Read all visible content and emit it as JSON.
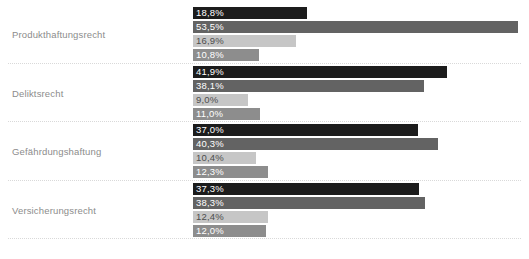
{
  "top_sliver_text": "",
  "axis": {
    "bar_origin_px": 193,
    "px_per_percent": 6.07
  },
  "palette": {
    "series_1": "#1c1c1c",
    "series_2": "#636363",
    "series_3": "#c6c6c6",
    "series_4": "#8d8d8d",
    "label_on_dark": "#ffffff",
    "label_on_light": "#4d4d4d",
    "category_label": "#8c8c8c",
    "separator": "#d9d9d9",
    "background": "#ffffff"
  },
  "chart_data": {
    "type": "bar",
    "orientation": "horizontal",
    "title": "",
    "subtitle": "",
    "xlabel": "",
    "ylabel": "",
    "xlim": [
      0,
      55
    ],
    "grid": false,
    "legend": "none",
    "value_suffix": "%",
    "decimal_separator": ",",
    "categories": [
      "Produkthaftungsrecht",
      "Deliktsrecht",
      "Gefährdungshaftung",
      "Versicherungsrecht"
    ],
    "series": [
      {
        "name": "series-1",
        "color": "#1c1c1c",
        "values": [
          18.8,
          41.9,
          37.0,
          37.3
        ]
      },
      {
        "name": "series-2",
        "color": "#636363",
        "values": [
          53.5,
          38.1,
          40.3,
          38.3
        ]
      },
      {
        "name": "series-3",
        "color": "#c6c6c6",
        "values": [
          16.9,
          9.0,
          10.4,
          12.4
        ]
      },
      {
        "name": "series-4",
        "color": "#8d8d8d",
        "values": [
          10.8,
          11.0,
          12.3,
          12.0
        ]
      }
    ],
    "groups": [
      {
        "category": "Produkthaftungsrecht",
        "top_px": 7,
        "bars": [
          {
            "value": 18.8,
            "label": "18,8%",
            "color": "#1c1c1c",
            "text_color": "#ffffff"
          },
          {
            "value": 53.5,
            "label": "53,5%",
            "color": "#636363",
            "text_color": "#ffffff"
          },
          {
            "value": 16.9,
            "label": "16,9%",
            "color": "#c6c6c6",
            "text_color": "#4d4d4d"
          },
          {
            "value": 10.8,
            "label": "10,8%",
            "color": "#8d8d8d",
            "text_color": "#ffffff"
          }
        ]
      },
      {
        "category": "Deliktsrecht",
        "top_px": 66,
        "bars": [
          {
            "value": 41.9,
            "label": "41,9%",
            "color": "#1c1c1c",
            "text_color": "#ffffff"
          },
          {
            "value": 38.1,
            "label": "38,1%",
            "color": "#636363",
            "text_color": "#ffffff"
          },
          {
            "value": 9.0,
            "label": "9,0%",
            "color": "#c6c6c6",
            "text_color": "#4d4d4d"
          },
          {
            "value": 11.0,
            "label": "11,0%",
            "color": "#8d8d8d",
            "text_color": "#ffffff"
          }
        ]
      },
      {
        "category": "Gefährdungshaftung",
        "top_px": 124,
        "bars": [
          {
            "value": 37.0,
            "label": "37,0%",
            "color": "#1c1c1c",
            "text_color": "#ffffff"
          },
          {
            "value": 40.3,
            "label": "40,3%",
            "color": "#636363",
            "text_color": "#ffffff"
          },
          {
            "value": 10.4,
            "label": "10,4%",
            "color": "#c6c6c6",
            "text_color": "#4d4d4d"
          },
          {
            "value": 12.3,
            "label": "12,3%",
            "color": "#8d8d8d",
            "text_color": "#ffffff"
          }
        ]
      },
      {
        "category": "Versicherungsrecht",
        "top_px": 183,
        "bars": [
          {
            "value": 37.3,
            "label": "37,3%",
            "color": "#1c1c1c",
            "text_color": "#ffffff"
          },
          {
            "value": 38.3,
            "label": "38,3%",
            "color": "#636363",
            "text_color": "#ffffff"
          },
          {
            "value": 12.4,
            "label": "12,4%",
            "color": "#c6c6c6",
            "text_color": "#4d4d4d"
          },
          {
            "value": 12.0,
            "label": "12,0%",
            "color": "#8d8d8d",
            "text_color": "#ffffff"
          }
        ]
      }
    ],
    "separators_px": [
      63,
      121,
      180,
      238
    ]
  }
}
